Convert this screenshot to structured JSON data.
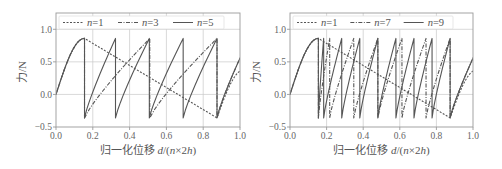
{
  "chart_data": [
    {
      "type": "line",
      "panel": "left",
      "title": "",
      "xlabel": "归一化位移 d/(n×2h)",
      "ylabel": "力/N",
      "xlim": [
        0.0,
        1.0
      ],
      "ylim": [
        -0.5,
        1.25
      ],
      "xticks": [
        "0.0",
        "0.2",
        "0.4",
        "0.6",
        "0.8",
        "1.0"
      ],
      "yticks": [
        "−0.5",
        "0.0",
        "0.5",
        "1.0"
      ],
      "grid": true,
      "legend_position": "top",
      "series": [
        {
          "name": "n=1",
          "style": "dashed",
          "n": 1
        },
        {
          "name": "n=3",
          "style": "dashdot",
          "n": 3
        },
        {
          "name": "n=5",
          "style": "solid",
          "n": 5
        }
      ],
      "unit_shape": {
        "description": "Per period (length 1/n): rise from ~0 to peak 0.86 at 15.5% of the period, then (n=1) linear descent to min -0.36 at 87.5%, then rise to ~0.38 at period end; for n>1 each module snaps down vertically from 0.86 to -0.36",
        "peak": 0.86,
        "trough": -0.36,
        "peak_x_fraction": 0.155,
        "trough_x_fraction": 0.875,
        "end_value": 0.38
      }
    },
    {
      "type": "line",
      "panel": "right",
      "title": "",
      "xlabel": "归一化位移 d/(n×2h)",
      "ylabel": "力/N",
      "xlim": [
        0.0,
        1.0
      ],
      "ylim": [
        -0.5,
        1.25
      ],
      "xticks": [
        "0.0",
        "0.2",
        "0.4",
        "0.6",
        "0.8",
        "1.0"
      ],
      "yticks": [
        "−0.5",
        "0.0",
        "0.5",
        "1.0"
      ],
      "grid": true,
      "legend_position": "top",
      "series": [
        {
          "name": "n=1",
          "style": "dashed",
          "n": 1
        },
        {
          "name": "n=7",
          "style": "dashdot",
          "n": 7
        },
        {
          "name": "n=9",
          "style": "solid",
          "n": 9
        }
      ],
      "unit_shape": {
        "peak": 0.86,
        "trough": -0.36,
        "peak_x_fraction": 0.155,
        "trough_x_fraction": 0.875,
        "end_value": 0.38
      }
    }
  ],
  "panels": [
    {
      "xlabel_cn": "归一化位移 ",
      "xlabel_math": "d",
      "xlabel_rest": "/(",
      "xlabel_n": "n",
      "xlabel_tail": "×2",
      "xlabel_h": "h",
      "xlabel_close": ")",
      "ylabel_cn": "力",
      "ylabel_unit": "/N",
      "legend": [
        {
          "n_label": "n",
          "value": "=1",
          "style": "dashed"
        },
        {
          "n_label": "n",
          "value": "=3",
          "style": "dashdot"
        },
        {
          "n_label": "n",
          "value": "=5",
          "style": "solid"
        }
      ]
    },
    {
      "xlabel_cn": "归一化位移 ",
      "xlabel_math": "d",
      "xlabel_rest": "/(",
      "xlabel_n": "n",
      "xlabel_tail": "×2",
      "xlabel_h": "h",
      "xlabel_close": ")",
      "ylabel_cn": "力",
      "ylabel_unit": "/N",
      "legend": [
        {
          "n_label": "n",
          "value": "=1",
          "style": "dashed"
        },
        {
          "n_label": "n",
          "value": "=7",
          "style": "dashdot"
        },
        {
          "n_label": "n",
          "value": "=9",
          "style": "solid"
        }
      ]
    }
  ],
  "colors": {
    "line": "#555555",
    "grid": "#c8c8c8",
    "frame": "#9a9a9a",
    "text": "#5a5a5a"
  }
}
